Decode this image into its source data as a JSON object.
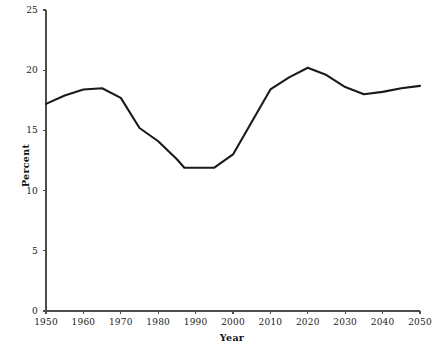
{
  "chart_data": {
    "type": "line",
    "title": "",
    "subtitle": "",
    "xlabel": "Year",
    "ylabel": "Percent",
    "xlim": [
      1950,
      2050
    ],
    "ylim": [
      0,
      25
    ],
    "xticks": [
      1950,
      1960,
      1970,
      1980,
      1990,
      2000,
      2010,
      2020,
      2030,
      2040,
      2050
    ],
    "xtick_labels": [
      "1950",
      "1960",
      "1970",
      "1980",
      "1990",
      "2000",
      "2010",
      "2020",
      "2030",
      "2040",
      "2050"
    ],
    "yticks": [
      0,
      5,
      10,
      15,
      20,
      25
    ],
    "ytick_labels": [
      "0",
      "5",
      "10",
      "15",
      "20",
      "25"
    ],
    "grid": false,
    "legend": null,
    "legend_position": "none",
    "line_color": "#1a1a1a",
    "line_width": 2.1,
    "background_color": "#ffffff",
    "axis_color": "#4d4d4d",
    "series": [
      {
        "name": "Percent",
        "x": [
          1950,
          1955,
          1960,
          1965,
          1970,
          1975,
          1980,
          1985,
          1987,
          1990,
          1995,
          2000,
          2005,
          2010,
          2015,
          2020,
          2025,
          2030,
          2035,
          2040,
          2045,
          2050
        ],
        "values": [
          17.2,
          17.9,
          18.4,
          18.5,
          17.7,
          15.2,
          14.1,
          12.6,
          11.9,
          11.9,
          11.9,
          13.0,
          15.7,
          18.4,
          19.4,
          20.2,
          19.6,
          18.6,
          18.0,
          18.2,
          18.5,
          18.7
        ]
      }
    ],
    "annotations": []
  }
}
